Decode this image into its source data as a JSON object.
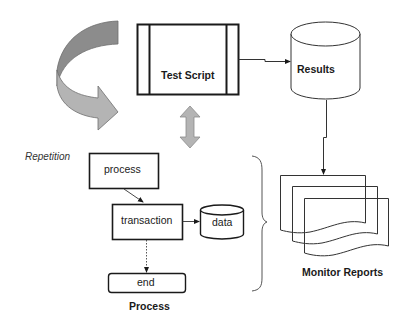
{
  "diagram": {
    "nodes": {
      "test_script": {
        "label": "Test Script",
        "shape": "predefined-process"
      },
      "results": {
        "label": "Results",
        "shape": "cylinder"
      },
      "monitor_reports": {
        "label": "Monitor Reports",
        "shape": "multi-document"
      },
      "process_box": {
        "label": "process",
        "shape": "rectangle"
      },
      "transaction": {
        "label": "transaction",
        "shape": "rectangle"
      },
      "data": {
        "label": "data",
        "shape": "cylinder"
      },
      "end": {
        "label": "end",
        "shape": "rounded-rectangle"
      }
    },
    "labels": {
      "repetition": "Repetition",
      "process_group": "Process"
    },
    "edges": [
      {
        "from": "test_script",
        "to": "results",
        "style": "solid-arrow"
      },
      {
        "from": "results",
        "to": "monitor_reports",
        "style": "solid-arrow"
      },
      {
        "from": "process_box",
        "to": "transaction",
        "style": "solid-arrow"
      },
      {
        "from": "transaction",
        "to": "data",
        "style": "solid-arrow"
      },
      {
        "from": "transaction",
        "to": "end",
        "style": "dotted-arrow"
      },
      {
        "from": "test_script",
        "to": "process_group",
        "style": "double-block-arrow"
      }
    ],
    "decorations": {
      "repetition_arrow": "curved-block-arrow",
      "group_brace": "right-curly-brace"
    },
    "colors": {
      "stroke": "#1a1a1a",
      "thin_stroke": "#333333",
      "arrow_dark": "#8c8c8c",
      "arrow_light": "#b4b4b4",
      "arrow_edge": "#6e6e6e",
      "background": "#ffffff"
    }
  }
}
